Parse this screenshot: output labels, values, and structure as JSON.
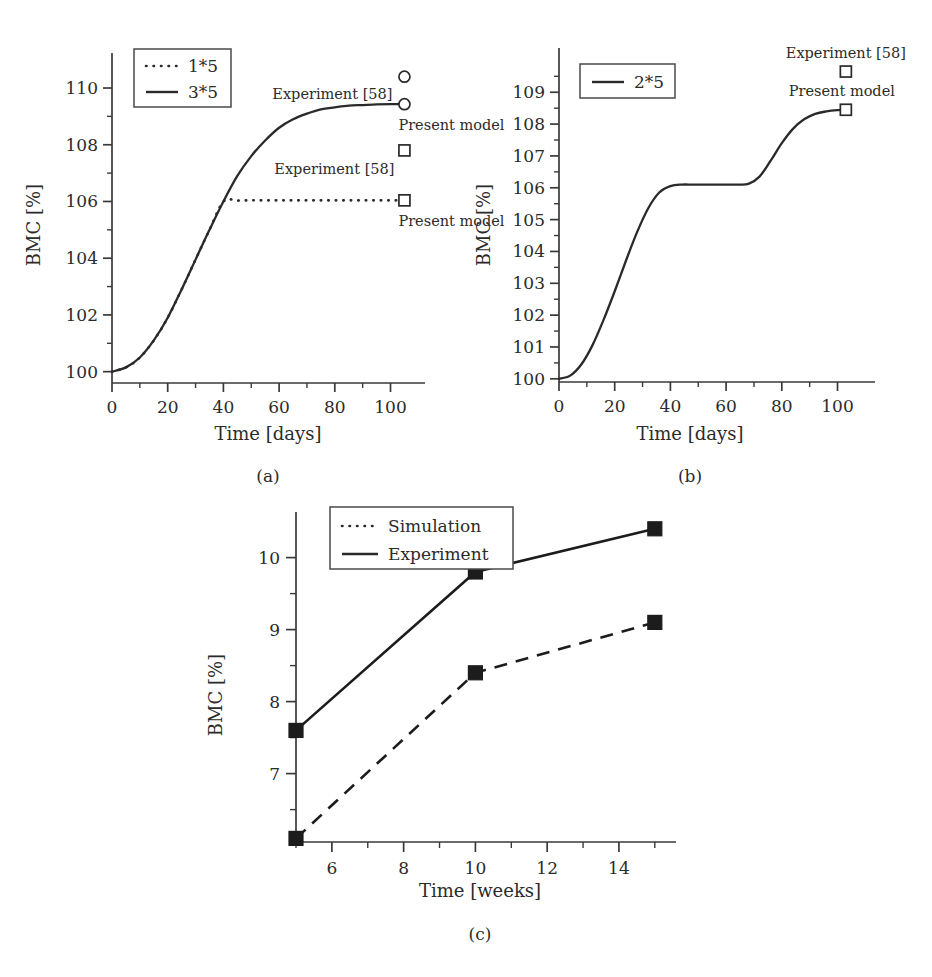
{
  "figure": {
    "panels": [
      {
        "id": "a",
        "caption": "(a)"
      },
      {
        "id": "b",
        "caption": "(b)"
      },
      {
        "id": "c",
        "caption": "(c)"
      }
    ]
  },
  "panel_a": {
    "caption": "(a)",
    "xlabel": "Time [days]",
    "ylabel": "BMC [%]",
    "x_ticks": [
      "0",
      "20",
      "40",
      "60",
      "80",
      "100"
    ],
    "y_ticks": [
      "100",
      "102",
      "104",
      "106",
      "108",
      "110"
    ],
    "legend": [
      {
        "label": "1*5",
        "style": "dotted"
      },
      {
        "label": "3*5",
        "style": "solid"
      }
    ],
    "annotations": [
      {
        "label": "Experiment [58]",
        "marker": "circle",
        "x": 105,
        "y": 110.4
      },
      {
        "label": "Present model",
        "marker": "circle",
        "x": 105,
        "y": 109.4
      },
      {
        "label": "Experiment [58]",
        "marker": "square",
        "x": 105,
        "y": 107.8
      },
      {
        "label": "Present model",
        "marker": "square",
        "x": 105,
        "y": 106.0
      }
    ]
  },
  "panel_b": {
    "caption": "(b)",
    "xlabel": "Time [days]",
    "ylabel": "BMC [%]",
    "x_ticks": [
      "0",
      "20",
      "40",
      "60",
      "80",
      "100"
    ],
    "y_ticks": [
      "100",
      "101",
      "102",
      "103",
      "104",
      "105",
      "106",
      "107",
      "108",
      "109"
    ],
    "legend": [
      {
        "label": "2*5",
        "style": "solid"
      }
    ],
    "annotations": [
      {
        "label": "Experiment [58]",
        "marker": "square",
        "x": 103,
        "y": 109.65
      },
      {
        "label": "Present model",
        "marker": "square",
        "x": 103,
        "y": 108.45
      }
    ]
  },
  "panel_c": {
    "caption": "(c)",
    "xlabel": "Time [weeks]",
    "ylabel": "BMC [%]",
    "x_ticks": [
      "6",
      "8",
      "10",
      "12",
      "14"
    ],
    "y_ticks": [
      "7",
      "8",
      "9",
      "10"
    ],
    "legend": [
      {
        "label": "Simulation",
        "style": "dotted"
      },
      {
        "label": "Experiment",
        "style": "solid"
      }
    ]
  },
  "chart_data": [
    {
      "panel": "a",
      "type": "line",
      "title": "",
      "xlabel": "Time [days]",
      "ylabel": "BMC [%]",
      "xlim": [
        0,
        107
      ],
      "ylim": [
        99.6,
        110.6
      ],
      "xticks": [
        0,
        20,
        40,
        60,
        80,
        100
      ],
      "yticks": [
        100,
        102,
        104,
        106,
        108,
        110
      ],
      "minor_yticks": [
        101,
        103,
        105,
        107,
        109
      ],
      "minor_xticks": [
        10,
        30,
        50,
        70,
        90
      ],
      "grid": false,
      "legend_position": "upper-left",
      "series": [
        {
          "name": "3*5",
          "style": "solid",
          "x": [
            0,
            5,
            10,
            15,
            20,
            25,
            30,
            35,
            40,
            45,
            50,
            55,
            60,
            65,
            70,
            75,
            80,
            85,
            90,
            95,
            100,
            105
          ],
          "y": [
            100.0,
            100.15,
            100.5,
            101.1,
            101.9,
            102.9,
            103.95,
            105.0,
            106.0,
            106.9,
            107.6,
            108.15,
            108.6,
            108.9,
            109.1,
            109.25,
            109.32,
            109.38,
            109.4,
            109.42,
            109.43,
            109.43
          ]
        },
        {
          "name": "1*5",
          "style": "dotted",
          "x": [
            0,
            5,
            10,
            15,
            20,
            25,
            30,
            35,
            40,
            45,
            50,
            55,
            60,
            65,
            70,
            75,
            80,
            85,
            90,
            95,
            100,
            105
          ],
          "y": [
            100.0,
            100.15,
            100.5,
            101.1,
            101.9,
            102.9,
            103.95,
            105.0,
            106.0,
            106.03,
            106.04,
            106.04,
            106.04,
            106.04,
            106.04,
            106.04,
            106.04,
            106.04,
            106.04,
            106.04,
            106.04,
            106.04
          ]
        }
      ],
      "annotations": [
        {
          "text": "Experiment [58]",
          "marker": "open-circle",
          "x": 105,
          "y": 110.4
        },
        {
          "text": "Present model",
          "marker": "open-circle",
          "x": 105,
          "y": 109.43
        },
        {
          "text": "Experiment [58]",
          "marker": "open-square",
          "x": 105,
          "y": 107.8
        },
        {
          "text": "Present model",
          "marker": "open-square",
          "x": 105,
          "y": 106.04
        }
      ]
    },
    {
      "panel": "b",
      "type": "line",
      "title": "",
      "xlabel": "Time [days]",
      "ylabel": "BMC [%]",
      "xlim": [
        0,
        107
      ],
      "ylim": [
        99.9,
        109.95
      ],
      "xticks": [
        0,
        20,
        40,
        60,
        80,
        100
      ],
      "yticks": [
        100,
        101,
        102,
        103,
        104,
        105,
        106,
        107,
        108,
        109
      ],
      "minor_yticks": [
        100.5,
        101.5,
        102.5,
        103.5,
        104.5,
        105.5,
        106.5,
        107.5,
        108.5,
        109.5
      ],
      "minor_xticks": [
        10,
        30,
        50,
        70,
        90
      ],
      "grid": false,
      "legend_position": "upper-left",
      "series": [
        {
          "name": "2*5",
          "style": "solid",
          "x": [
            0,
            4,
            8,
            12,
            16,
            20,
            24,
            28,
            32,
            36,
            40,
            44,
            48,
            52,
            56,
            60,
            64,
            68,
            72,
            76,
            80,
            84,
            88,
            92,
            96,
            100,
            103
          ],
          "y": [
            100.0,
            100.1,
            100.45,
            101.05,
            101.85,
            102.75,
            103.7,
            104.6,
            105.35,
            105.85,
            106.05,
            106.1,
            106.1,
            106.1,
            106.1,
            106.1,
            106.1,
            106.12,
            106.35,
            106.85,
            107.4,
            107.85,
            108.15,
            108.32,
            108.4,
            108.44,
            108.45
          ]
        }
      ],
      "annotations": [
        {
          "text": "Experiment [58]",
          "marker": "open-square",
          "x": 103,
          "y": 109.65
        },
        {
          "text": "Present model",
          "marker": "open-square",
          "x": 103,
          "y": 108.45
        }
      ]
    },
    {
      "panel": "c",
      "type": "line",
      "title": "",
      "xlabel": "Time [weeks]",
      "ylabel": "BMC [%]",
      "xlim": [
        5,
        15.2
      ],
      "ylim": [
        6.05,
        10.55
      ],
      "xticks": [
        6,
        8,
        10,
        12,
        14
      ],
      "yticks": [
        7,
        8,
        9,
        10
      ],
      "minor_yticks": [
        6.5,
        7.5,
        8.5,
        9.5
      ],
      "minor_xticks": [
        5,
        7,
        9,
        11,
        13,
        15
      ],
      "grid": false,
      "legend_position": "upper-left",
      "categories": [
        5,
        10,
        15
      ],
      "series": [
        {
          "name": "Experiment",
          "style": "solid",
          "x": [
            5,
            10,
            15
          ],
          "y": [
            7.6,
            9.8,
            10.4
          ],
          "marker": "filled-square"
        },
        {
          "name": "Simulation",
          "style": "dashed",
          "x": [
            5,
            10,
            15
          ],
          "y": [
            6.1,
            8.4,
            9.1
          ],
          "marker": "filled-square"
        }
      ]
    }
  ]
}
